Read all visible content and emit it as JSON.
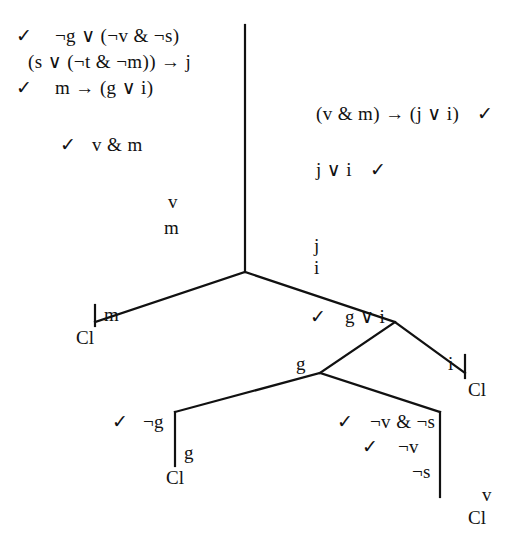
{
  "diagram": {
    "symbols": {
      "check": "✓",
      "negation": "¬",
      "disjunction": "∨",
      "conjunction": "&",
      "conditional": "→",
      "closed_marker": "Cl"
    },
    "ink_color": "#111111",
    "background_color": "#ffffff"
  },
  "trunk": {
    "premises": [
      {
        "id": "p1",
        "check": "✓",
        "text": "¬g ∨ (¬v & ¬s)",
        "x": 55,
        "y": 26
      },
      {
        "id": "p2",
        "check": "",
        "text": "(s ∨ (¬t & ¬m)) → j",
        "x": 28,
        "y": 50
      },
      {
        "id": "p3",
        "check": "✓",
        "text": "m → (g ∨ i)",
        "x": 55,
        "y": 76
      },
      {
        "id": "p4",
        "check": "✓",
        "text": "v & m",
        "x": 85,
        "y": 135
      }
    ],
    "decomposed_left": [
      {
        "id": "d1",
        "text": "v",
        "x": 168,
        "y": 192
      },
      {
        "id": "d2",
        "text": "m",
        "x": 164,
        "y": 218
      }
    ],
    "right_branch": [
      {
        "id": "r1",
        "text": "(v & m) → (j ∨ i)",
        "check_after": "✓",
        "x": 316,
        "y": 104
      },
      {
        "id": "r2",
        "text": "j ∨ i",
        "check_after": "✓",
        "x": 316,
        "y": 160
      }
    ],
    "decomposed_right": [
      {
        "id": "d3",
        "text": "j",
        "x": 314,
        "y": 236
      },
      {
        "id": "d4",
        "text": "i",
        "x": 314,
        "y": 258
      }
    ]
  },
  "branches": {
    "fork1_left": {
      "nodes": [
        {
          "id": "b1",
          "text": "m",
          "x": 102,
          "y": 305
        }
      ],
      "closed": {
        "marker": "Cl",
        "x": 76,
        "y": 325
      }
    },
    "fork1_right": {
      "nodes": [
        {
          "id": "b2",
          "check": "✓",
          "text": "g ∨ i",
          "x": 338,
          "y": 307
        }
      ]
    },
    "fork2_left": {
      "nodes": [
        {
          "id": "b3",
          "text": "g",
          "x": 296,
          "y": 355
        }
      ]
    },
    "fork2_right": {
      "nodes": [
        {
          "id": "b4",
          "text": "i",
          "x": 448,
          "y": 355
        }
      ],
      "closed": {
        "marker": "Cl",
        "x": 466,
        "y": 378
      }
    },
    "fork3_left": {
      "nodes": [
        {
          "id": "b5",
          "check": "✓",
          "text": "¬g",
          "x": 135,
          "y": 412
        },
        {
          "id": "b6",
          "text": "g",
          "x": 184,
          "y": 443
        }
      ],
      "closed": {
        "marker": "Cl",
        "x": 168,
        "y": 468
      }
    },
    "fork3_right": {
      "nodes": [
        {
          "id": "b7",
          "check": "✓",
          "text": "¬v & ¬s",
          "x": 360,
          "y": 412
        },
        {
          "id": "b8",
          "check": "✓",
          "text": "¬v",
          "x": 388,
          "y": 437
        },
        {
          "id": "b9",
          "text": "¬s",
          "x": 412,
          "y": 462
        },
        {
          "id": "b10",
          "text": "v",
          "x": 482,
          "y": 485
        }
      ],
      "closed": {
        "marker": "Cl",
        "x": 470,
        "y": 506
      }
    }
  },
  "geometry": {
    "trunk_line": {
      "x": 245,
      "y1": 25,
      "y2": 272
    },
    "fork1": {
      "x": 245,
      "y": 272,
      "left_x": 95,
      "right_x": 395,
      "child_y": 322
    },
    "fork1_left_stub": {
      "x": 95,
      "y1": 305,
      "y2": 326
    },
    "fork2": {
      "x": 395,
      "y": 322,
      "left_x": 320,
      "right_x": 465,
      "child_y": 373
    },
    "fork2_right_stub": {
      "x": 465,
      "y1": 355,
      "y2": 376
    },
    "fork3": {
      "x": 320,
      "y": 373,
      "left_x": 175,
      "right_x": 440,
      "child_y": 412
    },
    "fork3_left_stub": {
      "x": 175,
      "y1": 412,
      "y2": 466
    },
    "fork3_right_stub": {
      "x": 440,
      "y1": 412,
      "y2": 497
    }
  }
}
